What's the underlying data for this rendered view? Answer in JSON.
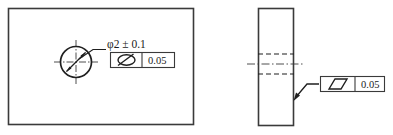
{
  "drawing": {
    "title": "GD&T Technical Drawing - Hole Position and Parallelism",
    "line_color": "#333333",
    "text_color": "#1a1a1a",
    "background": "#ffffff"
  },
  "front_view": {
    "name": "front-view",
    "outline": {
      "x": 8,
      "y": 8,
      "width": 185,
      "height": 117
    },
    "hole": {
      "name": "hole-circle",
      "cx": 76,
      "cy": 62,
      "r": 16,
      "centerline_extension": 7,
      "dimension_arrow": "double-headed-diagonal"
    },
    "dimension_label": {
      "text": "φ2 ± 0.1",
      "x": 107,
      "y": 47
    },
    "leader": {
      "name": "leader-line-front",
      "points": "76,62 92,50 106,50"
    },
    "feature_control_frame": {
      "name": "feature-control-frame-front",
      "x": 110,
      "y": 52,
      "width": 65,
      "height": 16,
      "divider_x": 142,
      "symbol": "circularity-with-slash-icon",
      "symbol_meaning": "roundness/position symbol (circle with diagonal line)",
      "tolerance": "0.05"
    }
  },
  "side_view": {
    "name": "side-view",
    "outline": {
      "x": 258,
      "y": 8,
      "width": 36,
      "height": 118
    },
    "hidden_lines": [
      {
        "name": "hidden-line-top",
        "y": 54,
        "x1": 258,
        "x2": 294
      },
      {
        "name": "hidden-line-bottom",
        "y": 74,
        "x1": 258,
        "x2": 294
      }
    ],
    "centerline": {
      "name": "center-line-side",
      "y": 64,
      "x1": 248,
      "x2": 304
    },
    "leader": {
      "name": "leader-line-side",
      "points": "294,100 306,84 319,84",
      "arrow_at": "294,100"
    },
    "feature_control_frame": {
      "name": "feature-control-frame-side",
      "x": 320,
      "y": 76,
      "width": 65,
      "height": 16,
      "divider_x": 355,
      "symbol": "parallelism-icon",
      "symbol_meaning": "parallelism (parallelogram)",
      "tolerance": "0.05"
    }
  }
}
